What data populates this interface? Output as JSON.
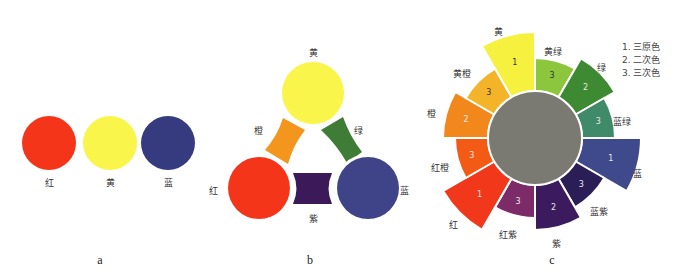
{
  "panels": {
    "a": {
      "caption": "a",
      "circles": [
        {
          "name": "red",
          "label": "红",
          "color": "#f5351a",
          "cx": 49,
          "cy": 143,
          "r": 27,
          "label_x": 49,
          "label_y": 182
        },
        {
          "name": "yellow",
          "label": "黄",
          "color": "#faf54a",
          "cx": 110,
          "cy": 143,
          "r": 27,
          "label_x": 110,
          "label_y": 182
        },
        {
          "name": "blue",
          "label": "蓝",
          "color": "#363a7e",
          "cx": 168,
          "cy": 143,
          "r": 27,
          "label_x": 168,
          "label_y": 182
        }
      ]
    },
    "b": {
      "caption": "b",
      "circles": [
        {
          "name": "yellow",
          "label": "黄",
          "color": "#faf54a",
          "cx": 313,
          "cy": 93,
          "r": 31,
          "label_x": 313,
          "label_y": 52
        },
        {
          "name": "red",
          "label": "红",
          "color": "#f5351a",
          "cx": 259,
          "cy": 188,
          "r": 31,
          "label_x": 213,
          "label_y": 190
        },
        {
          "name": "blue",
          "label": "蓝",
          "color": "#3f4488",
          "cx": 368,
          "cy": 188,
          "r": 31,
          "label_x": 404,
          "label_y": 190
        }
      ],
      "mixes": [
        {
          "name": "orange",
          "label": "橙",
          "color": "#f4951e",
          "label_x": 258,
          "label_y": 130,
          "points": [
            [
              283,
              118
            ],
            [
              305,
              130
            ],
            [
              288,
              164
            ],
            [
              265,
              150
            ]
          ]
        },
        {
          "name": "green",
          "label": "绿",
          "color": "#3f7c35",
          "label_x": 358,
          "label_y": 130,
          "points": [
            [
              321,
              130
            ],
            [
              343,
              117
            ],
            [
              362,
              152
            ],
            [
              347,
              163
            ]
          ]
        },
        {
          "name": "violet",
          "label": "紫",
          "color": "#3c1a5a",
          "label_x": 313,
          "label_y": 218,
          "points": [
            [
              293,
              173
            ],
            [
              332,
              173
            ],
            [
              332,
              204
            ],
            [
              293,
              204
            ]
          ]
        }
      ]
    },
    "c": {
      "caption": "c",
      "center": {
        "cx": 535,
        "cy": 138,
        "r": 47,
        "color": "#7a7a72"
      },
      "segments": [
        {
          "name": "yellow",
          "label": "黄",
          "num": "1",
          "color": "#f6f03e",
          "start": 330,
          "end": 360,
          "r": 106,
          "label_x": 498,
          "label_y": 31
        },
        {
          "name": "yellow-green",
          "label": "黄绿",
          "num": "3",
          "color": "#8cc63c",
          "start": 0,
          "end": 30,
          "r": 80,
          "label_x": 553,
          "label_y": 51
        },
        {
          "name": "green",
          "label": "绿",
          "num": "2",
          "color": "#3e8a32",
          "start": 30,
          "end": 60,
          "r": 92,
          "label_x": 601,
          "label_y": 67
        },
        {
          "name": "blue-green",
          "label": "蓝绿",
          "num": "3",
          "color": "#3f8a68",
          "start": 60,
          "end": 90,
          "r": 80,
          "label_x": 622,
          "label_y": 121
        },
        {
          "name": "blue",
          "label": "蓝",
          "num": "1",
          "color": "#3e4a8c",
          "start": 90,
          "end": 120,
          "r": 106,
          "label_x": 637,
          "label_y": 173
        },
        {
          "name": "blue-violet",
          "label": "蓝紫",
          "num": "3",
          "color": "#2b1d55",
          "start": 120,
          "end": 150,
          "r": 80,
          "label_x": 599,
          "label_y": 211
        },
        {
          "name": "violet",
          "label": "紫",
          "num": "2",
          "color": "#3b1a5e",
          "start": 150,
          "end": 180,
          "r": 92,
          "label_x": 556,
          "label_y": 243
        },
        {
          "name": "red-violet",
          "label": "红紫",
          "num": "3",
          "color": "#7c2b68",
          "start": 180,
          "end": 210,
          "r": 80,
          "label_x": 508,
          "label_y": 234
        },
        {
          "name": "red",
          "label": "红",
          "num": "1",
          "color": "#f1381a",
          "start": 210,
          "end": 240,
          "r": 106,
          "label_x": 453,
          "label_y": 224
        },
        {
          "name": "red-orange",
          "label": "红橙",
          "num": "3",
          "color": "#f25a16",
          "start": 240,
          "end": 270,
          "r": 80,
          "label_x": 440,
          "label_y": 167
        },
        {
          "name": "orange",
          "label": "橙",
          "num": "2",
          "color": "#f2881c",
          "start": 270,
          "end": 300,
          "r": 92,
          "label_x": 431,
          "label_y": 113
        },
        {
          "name": "yellow-orange",
          "label": "黄橙",
          "num": "3",
          "color": "#f3b42a",
          "start": 300,
          "end": 330,
          "r": 80,
          "label_x": 462,
          "label_y": 73
        }
      ],
      "legend": [
        "1. 三原色",
        "2. 二次色",
        "3. 三次色"
      ]
    }
  },
  "captions": {
    "a": {
      "text": "a",
      "x": 100,
      "y": 260
    },
    "b": {
      "text": "b",
      "x": 310,
      "y": 260
    },
    "c": {
      "text": "c",
      "x": 552,
      "y": 260
    }
  }
}
